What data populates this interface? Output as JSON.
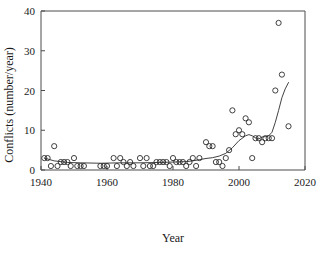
{
  "chart_data": {
    "type": "scatter",
    "title": "",
    "xlabel": "Year",
    "ylabel": "Conflicts (number/year)",
    "xlim": [
      1940,
      2020
    ],
    "ylim": [
      0,
      40
    ],
    "xticks": [
      1940,
      1960,
      1980,
      2000,
      2020
    ],
    "yticks": [
      0,
      10,
      20,
      30,
      40
    ],
    "xtick_labels": [
      "1940",
      "1960",
      "1980",
      "2000",
      "2020"
    ],
    "ytick_labels": [
      "0",
      "10",
      "20",
      "30",
      "40"
    ],
    "grid": false,
    "legend": null,
    "marker": "open-circle",
    "marker_color": "#2b2b2b",
    "line_color": "#2b2b2b",
    "series": [
      {
        "name": "Conflicts per year",
        "type": "scatter",
        "x": [
          1941,
          1942,
          1943,
          1944,
          1945,
          1946,
          1947,
          1948,
          1949,
          1950,
          1951,
          1952,
          1953,
          1958,
          1959,
          1960,
          1962,
          1963,
          1964,
          1965,
          1966,
          1967,
          1968,
          1970,
          1971,
          1972,
          1973,
          1974,
          1975,
          1976,
          1977,
          1978,
          1979,
          1980,
          1981,
          1982,
          1983,
          1984,
          1985,
          1986,
          1987,
          1988,
          1990,
          1991,
          1992,
          1993,
          1994,
          1995,
          1996,
          1997,
          1998,
          1999,
          2000,
          2001,
          2002,
          2003,
          2004,
          2005,
          2006,
          2007,
          2008,
          2009,
          2010,
          2011,
          2012,
          2013,
          2015
        ],
        "y": [
          3,
          3,
          1,
          6,
          1,
          2,
          2,
          2,
          1,
          3,
          1,
          1,
          1,
          1,
          1,
          1,
          3,
          1,
          3,
          2,
          1,
          2,
          1,
          3,
          1,
          3,
          1,
          1,
          2,
          2,
          2,
          2,
          1,
          3,
          2,
          2,
          2,
          1,
          2,
          3,
          1,
          3,
          7,
          6,
          6,
          2,
          2,
          1,
          3,
          5,
          15,
          9,
          10,
          9,
          13,
          12,
          3,
          8,
          8,
          7,
          8,
          8,
          8,
          20,
          37,
          24,
          11
        ]
      },
      {
        "name": "Smoothed trend",
        "type": "line",
        "x": [
          1941,
          1944,
          1948,
          1952,
          1958,
          1964,
          1970,
          1976,
          1980,
          1984,
          1986,
          1988,
          1990,
          1992,
          1994,
          1996,
          1998,
          2000,
          2002,
          2003,
          2004,
          2005,
          2006,
          2007,
          2008,
          2009,
          2010,
          2011,
          2012,
          2013,
          2014,
          2015
        ],
        "y": [
          3.0,
          2.3,
          1.9,
          1.8,
          1.7,
          1.8,
          1.8,
          1.9,
          2.0,
          2.1,
          2.3,
          2.6,
          2.9,
          3.1,
          3.5,
          4.2,
          5.6,
          7.4,
          8.6,
          8.9,
          8.6,
          8.1,
          7.8,
          8.3,
          8.4,
          8.6,
          9.5,
          12.0,
          15.0,
          18.2,
          20.4,
          22.0
        ]
      }
    ],
    "notable_points": {
      "max_outlier": {
        "x": 2012,
        "y": 37
      },
      "second_peak": {
        "x": 2013,
        "y": 24
      },
      "mid_peak": {
        "x": 1998,
        "y": 15
      }
    }
  }
}
